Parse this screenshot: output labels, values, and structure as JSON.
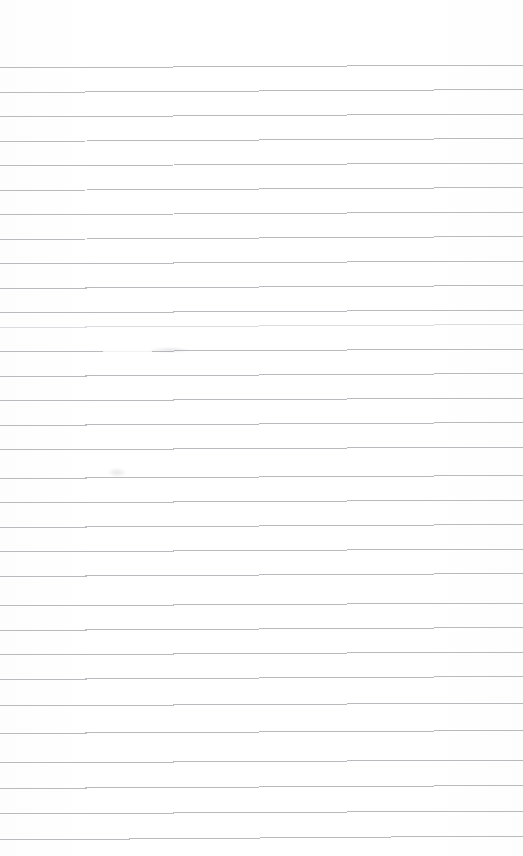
{
  "document": {
    "kind": "scanned-ruled-paper",
    "title": "Blank lined notepad page",
    "page_width": 523,
    "page_height": 856,
    "background_color": "#ffffff",
    "rule_color": "#b9b9be",
    "rule_color_dark": "#9a9aa2",
    "rule_color_faint": "#dcdce0",
    "top_margin_height": 62,
    "text_content": "",
    "visible_text": []
  },
  "ruling": {
    "line_spacing": 24.5,
    "first_line_y": 68,
    "line_count": 32,
    "line_thickness": 1,
    "left_x": 0,
    "right_x": 523,
    "skew_rise_px": 3,
    "comment": "horizontal ruled lines, scanned with slight upward skew to the right"
  },
  "lines": [
    {
      "index": 1,
      "y_left": 68.0,
      "y_right": 65.0,
      "shade": "normal"
    },
    {
      "index": 2,
      "y_left": 92.5,
      "y_right": 89.5,
      "shade": "normal"
    },
    {
      "index": 3,
      "y_left": 117.0,
      "y_right": 114.0,
      "shade": "normal"
    },
    {
      "index": 4,
      "y_left": 141.5,
      "y_right": 138.5,
      "shade": "normal"
    },
    {
      "index": 5,
      "y_left": 166.0,
      "y_right": 163.0,
      "shade": "normal"
    },
    {
      "index": 6,
      "y_left": 190.5,
      "y_right": 187.5,
      "shade": "normal"
    },
    {
      "index": 7,
      "y_left": 215.0,
      "y_right": 212.0,
      "shade": "normal"
    },
    {
      "index": 8,
      "y_left": 239.5,
      "y_right": 236.5,
      "shade": "normal"
    },
    {
      "index": 9,
      "y_left": 264.0,
      "y_right": 261.0,
      "shade": "normal"
    },
    {
      "index": 10,
      "y_left": 288.5,
      "y_right": 285.5,
      "shade": "normal"
    },
    {
      "index": 11,
      "y_left": 313.0,
      "y_right": 310.0,
      "shade": "normal"
    },
    {
      "index": 12,
      "y_left": 327.5,
      "y_right": 324.5,
      "shade": "faint"
    },
    {
      "index": 13,
      "y_left": 352.0,
      "y_right": 349.0,
      "shade": "broken"
    },
    {
      "index": 14,
      "y_left": 376.5,
      "y_right": 373.5,
      "shade": "normal"
    },
    {
      "index": 15,
      "y_left": 401.0,
      "y_right": 398.0,
      "shade": "normal"
    },
    {
      "index": 16,
      "y_left": 425.5,
      "y_right": 422.5,
      "shade": "normal"
    },
    {
      "index": 17,
      "y_left": 450.0,
      "y_right": 447.0,
      "shade": "normal"
    },
    {
      "index": 18,
      "y_left": 478.5,
      "y_right": 475.5,
      "shade": "normal"
    },
    {
      "index": 19,
      "y_left": 503.0,
      "y_right": 500.0,
      "shade": "normal"
    },
    {
      "index": 20,
      "y_left": 527.5,
      "y_right": 524.5,
      "shade": "normal"
    },
    {
      "index": 21,
      "y_left": 552.0,
      "y_right": 549.0,
      "shade": "normal"
    },
    {
      "index": 22,
      "y_left": 576.5,
      "y_right": 573.5,
      "shade": "normal"
    },
    {
      "index": 23,
      "y_left": 606.0,
      "y_right": 603.0,
      "shade": "normal"
    },
    {
      "index": 24,
      "y_left": 630.5,
      "y_right": 627.5,
      "shade": "normal"
    },
    {
      "index": 25,
      "y_left": 655.0,
      "y_right": 652.0,
      "shade": "normal"
    },
    {
      "index": 26,
      "y_left": 679.5,
      "y_right": 676.5,
      "shade": "normal"
    },
    {
      "index": 27,
      "y_left": 706.0,
      "y_right": 703.0,
      "shade": "normal"
    },
    {
      "index": 28,
      "y_left": 733.5,
      "y_right": 730.5,
      "shade": "normal"
    },
    {
      "index": 29,
      "y_left": 763.0,
      "y_right": 760.0,
      "shade": "normal"
    },
    {
      "index": 30,
      "y_left": 788.5,
      "y_right": 785.5,
      "shade": "normal"
    },
    {
      "index": 31,
      "y_left": 814.0,
      "y_right": 811.0,
      "shade": "normal"
    },
    {
      "index": 32,
      "y_left": 840.0,
      "y_right": 836.0,
      "shade": "normal"
    }
  ],
  "artifacts": [
    {
      "name": "line-break-gap",
      "on_line_index": 13,
      "x_start": 103,
      "x_end": 152,
      "description": "faded gap where the ruled line drops out"
    },
    {
      "name": "smudge",
      "x": 108,
      "y": 468,
      "width": 18,
      "height": 9,
      "description": "faint gray scan smudge above a ruled line"
    },
    {
      "name": "smudge",
      "x": 150,
      "y": 347,
      "width": 40,
      "height": 6,
      "description": "darker re-inked segment after the line break"
    }
  ]
}
